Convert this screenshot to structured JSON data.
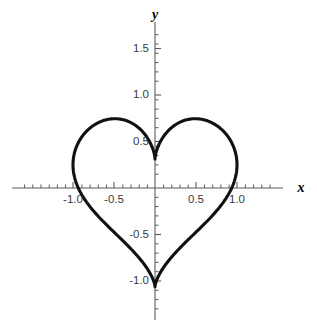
{
  "chart_data": {
    "type": "line",
    "title": "",
    "xlabel": "x",
    "ylabel": "y",
    "xlim": [
      -1.74,
      1.62
    ],
    "ylim": [
      -1.42,
      1.62
    ],
    "grid": false,
    "legend": null,
    "curve_name": "heart curve",
    "parametric": {
      "x_expression": "16 sin^3(t) / 16",
      "y_expression": "(13 cos t - 5 cos 2t - 2 cos 3t - cos 4t) / 16",
      "t_range": [
        0,
        6.283185307
      ]
    },
    "key_points": {
      "top_cusp": [
        0,
        1.0
      ],
      "bottom_tip": [
        0,
        -1.0
      ],
      "left_lobe_peak": [
        -0.55,
        1.22
      ],
      "right_lobe_peak": [
        0.55,
        1.22
      ],
      "leftmost": [
        -1.12,
        0.0
      ],
      "rightmost": [
        1.12,
        0.0
      ]
    },
    "x_ticks_major": [
      -1.0,
      -0.5,
      0.5,
      1.0
    ],
    "x_tick_labels": [
      "-1.0",
      "-0.5",
      "0.5",
      "1.0"
    ],
    "y_ticks_major": [
      -1.0,
      -0.5,
      0.5,
      1.0,
      1.5
    ],
    "y_tick_labels": [
      "-1.0",
      "-0.5",
      "0.5",
      "1.0",
      "1.5"
    ],
    "minor_tick_step": 0.1,
    "curve_color": "#111111",
    "axis_color": "#5b5b5b",
    "label_color": "#3b3b3b",
    "background_color": "#ffffff"
  },
  "axes": {
    "x_name": "x",
    "y_name": "y"
  },
  "x_tick_text": {
    "t0": "-1.0",
    "t1": "-0.5",
    "t2": "0.5",
    "t3": "1.0"
  },
  "y_tick_text": {
    "t0": "1.5",
    "t1": "1.0",
    "t2": "0.5",
    "t3": "-0.5",
    "t4": "-1.0"
  }
}
